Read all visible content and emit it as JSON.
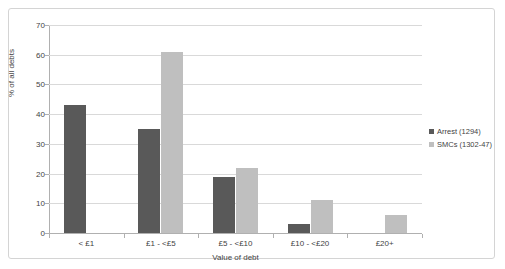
{
  "chart_data": {
    "type": "bar",
    "title": "",
    "xlabel": "Value of debt",
    "ylabel": "% of all debts",
    "ylim": [
      0,
      70
    ],
    "ytick_step": 10,
    "yticks": [
      0,
      10,
      20,
      30,
      40,
      50,
      60,
      70
    ],
    "grid": true,
    "legend_position": "right",
    "categories": [
      "< £1",
      "£1 - <£5",
      "£5 - <£10",
      "£10 - <£20",
      "£20+"
    ],
    "series": [
      {
        "name": "Arrest (1294)",
        "color": "#595959",
        "values": [
          43,
          35,
          19,
          3,
          0
        ]
      },
      {
        "name": "SMCs (1302-47)",
        "color": "#bfbfbf",
        "values": [
          0,
          61,
          22,
          11,
          6
        ]
      }
    ]
  },
  "legend": {
    "items": [
      {
        "label": "Arrest (1294)",
        "swatch": "arrest"
      },
      {
        "label": "SMCs (1302-47)",
        "swatch": "smcs"
      }
    ]
  },
  "colors": {
    "arrest": "#595959",
    "smcs": "#bfbfbf",
    "gridline": "#d9d9d9",
    "axis": "#b0b0b0",
    "border": "#d4d4d4",
    "text": "#3f3f3f",
    "background": "#ffffff"
  }
}
